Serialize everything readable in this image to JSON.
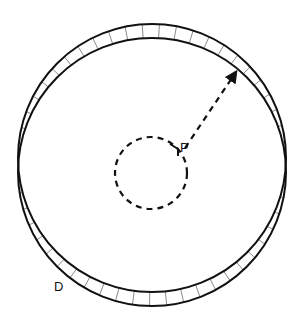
{
  "diagram": {
    "labels": {
      "point": "P",
      "disk": "D"
    },
    "outer_circle_upper": {
      "cx": 152,
      "cy": 158,
      "r": 134
    },
    "outer_circle_lower": {
      "cx": 152,
      "cy": 172,
      "r": 134
    },
    "inner_dashed_circle": {
      "cx": 151,
      "cy": 173,
      "r": 36
    },
    "arrow": {
      "from": [
        185,
        147
      ],
      "to": [
        238,
        70
      ]
    },
    "stroke_color": "#111111",
    "hatch_color": "#888888"
  }
}
